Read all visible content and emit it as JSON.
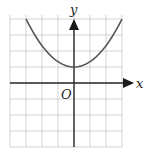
{
  "chart_data": {
    "type": "line",
    "title": "",
    "xlabel": "x",
    "ylabel": "y",
    "origin_label": "O",
    "xlim": [
      -4,
      3
    ],
    "ylim": [
      -4,
      4
    ],
    "grid": true,
    "legend": "none",
    "function": "y = 1 + x^2/3",
    "series": [
      {
        "name": "curve",
        "x": [
          -3,
          -2.5,
          -2,
          -1.5,
          -1,
          -0.5,
          0,
          0.5,
          1,
          1.5,
          2,
          2.5,
          3
        ],
        "y": [
          4,
          3.08,
          2.33,
          1.75,
          1.33,
          1.08,
          1,
          1.08,
          1.33,
          1.75,
          2.33,
          3.08,
          4
        ]
      }
    ],
    "colors": {
      "curve": "#555555",
      "axes": "#2a2a2a",
      "grid": "#c8c8c8"
    }
  }
}
